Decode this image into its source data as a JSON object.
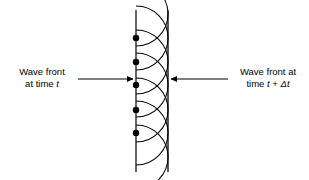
{
  "figure": {
    "type": "physics-diagram",
    "topic": "huygens-principle-plane-wave",
    "background_color": "#ffffff",
    "stroke_color": "#000000",
    "width": 309,
    "height": 180
  },
  "labels": {
    "left": {
      "line1": "Wave front",
      "line2_prefix": "at time ",
      "line2_symbol": "t"
    },
    "right": {
      "line1": "Wave front at",
      "line2_prefix": "time ",
      "line2_symbol": "t",
      "line2_middle": " + ",
      "line2_symbol2": "Δt"
    }
  },
  "geometry": {
    "old_front_x": 136,
    "new_front_x": 168,
    "front_top_y": 10,
    "front_bottom_y": 172,
    "wavelet_radius": 32,
    "source_points_y": [
      38,
      62,
      85,
      110,
      133
    ],
    "dot_radius": 3.2,
    "arrow_y": 79,
    "left_arrow_tail_x": 78,
    "left_arrow_head_x": 136,
    "right_arrow_tail_x": 228,
    "right_arrow_head_x": 168
  }
}
